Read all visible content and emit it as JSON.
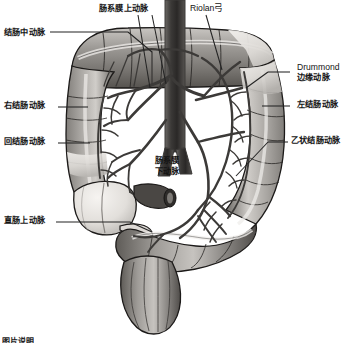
{
  "figure": {
    "type": "anatomical-illustration",
    "subject": "结肠",
    "palette": {
      "background": "#ffffff",
      "outline": "#1a1a1a",
      "vessel": "#4a4a4a",
      "bowel_light": "#e8e6e2",
      "bowel_mid": "#a9a6a2",
      "bowel_dark": "#6e6b67",
      "label_text": "#141414",
      "leader_line": "#232323"
    }
  },
  "labels": [
    {
      "id": "middle-colic-artery",
      "text": "结肠中动脉",
      "side": "left",
      "x": 4,
      "y": 28,
      "lines": [
        "结肠中动脉"
      ]
    },
    {
      "id": "superior-mesenteric-artery",
      "text": "肠系膜上动脉",
      "side": "top",
      "x": 99,
      "y": 4,
      "lines": [
        "肠系膜上动脉"
      ]
    },
    {
      "id": "riolan-arch",
      "text": "Riolan弓",
      "side": "top",
      "x": 190,
      "y": 3,
      "lines": [
        "Riolan弓"
      ]
    },
    {
      "id": "drummond-marginal-artery",
      "text": "Drummond\n边缘动脉",
      "side": "right",
      "x": 297,
      "y": 62,
      "lines": [
        "Drummond",
        "边缘动脉"
      ]
    },
    {
      "id": "left-colic-artery",
      "text": "左结肠动脉",
      "side": "right",
      "x": 297,
      "y": 100,
      "lines": [
        "左结肠动脉"
      ]
    },
    {
      "id": "sigmoid-artery",
      "text": "乙状结肠动脉",
      "side": "right",
      "x": 291,
      "y": 136,
      "lines": [
        "乙状结肠动脉"
      ]
    },
    {
      "id": "right-colic-artery",
      "text": "右结肠动脉",
      "side": "left",
      "x": 4,
      "y": 101,
      "lines": [
        "右结肠动脉"
      ]
    },
    {
      "id": "ileocolic-artery",
      "text": "回结肠动脉",
      "side": "left",
      "x": 4,
      "y": 137,
      "lines": [
        "回结肠动脉"
      ]
    },
    {
      "id": "superior-rectal-artery",
      "text": "直肠上动脉",
      "side": "left",
      "x": 4,
      "y": 216,
      "lines": [
        "直肠上动脉"
      ]
    },
    {
      "id": "inferior-mesenteric-artery",
      "text": "肠系膜\n下动脉",
      "side": "center",
      "x": 155,
      "y": 156,
      "lines": [
        "肠系膜",
        "下动脉"
      ]
    }
  ],
  "footer": {
    "caption": "图片说明"
  }
}
